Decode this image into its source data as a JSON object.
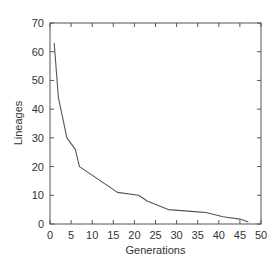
{
  "chart_data": {
    "type": "line",
    "title": "",
    "xlabel": "Generations",
    "ylabel": "Lineages",
    "xlim": [
      0,
      50
    ],
    "ylim": [
      0,
      70
    ],
    "xticks": [
      0,
      5,
      10,
      15,
      20,
      25,
      30,
      35,
      40,
      45,
      50
    ],
    "yticks": [
      0,
      10,
      20,
      30,
      40,
      50,
      60,
      70
    ],
    "grid": false,
    "legend": null,
    "series": [
      {
        "name": "Lineages",
        "color": "#555555",
        "x": [
          1,
          2,
          4,
          6,
          7,
          16,
          21,
          23,
          28,
          35,
          37,
          41,
          45,
          47
        ],
        "y": [
          63,
          44,
          30,
          26,
          20,
          11,
          10,
          8,
          5,
          4.2,
          4,
          2.5,
          1.7,
          0.7
        ]
      }
    ]
  },
  "colors": {
    "axis": "#555555",
    "line": "#555555",
    "text": "#333333",
    "background": "#ffffff"
  }
}
